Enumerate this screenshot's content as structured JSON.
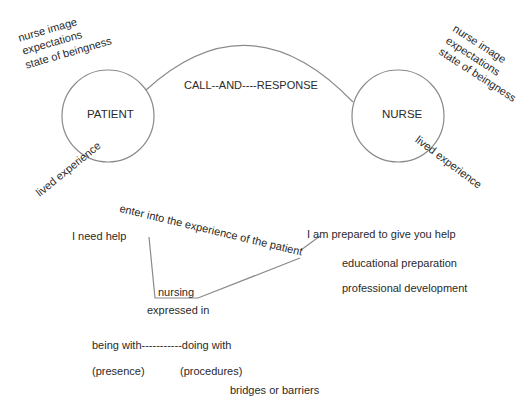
{
  "diagram": {
    "nodes": {
      "patient": {
        "label": "PATIENT"
      },
      "nurse": {
        "label": "NURSE"
      }
    },
    "connector": {
      "label": "CALL--AND----RESPONSE"
    },
    "patient_attributes": [
      "nurse image",
      "expectations",
      "state of beingness"
    ],
    "nurse_attributes": [
      "nurse image",
      "expectations",
      "state of beingness"
    ],
    "patient_lived_experience": "lived experience",
    "nurse_lived_experience": "lived experience",
    "patient_statement": "I need help",
    "nurse_statement": "I am prepared to give you help",
    "bridge_label": "enter into the experience of the patient",
    "nursing_label": "nursing",
    "expressed_in": "expressed in",
    "nurse_preparation": [
      "educational preparation",
      "professional development"
    ],
    "modes": {
      "line": "being with-----------doing with",
      "presence": "(presence)",
      "procedures": "(procedures)"
    },
    "outcome": "bridges or barriers",
    "colors": {
      "line": "#8a8a8a",
      "text": "#2a2a2a"
    }
  }
}
